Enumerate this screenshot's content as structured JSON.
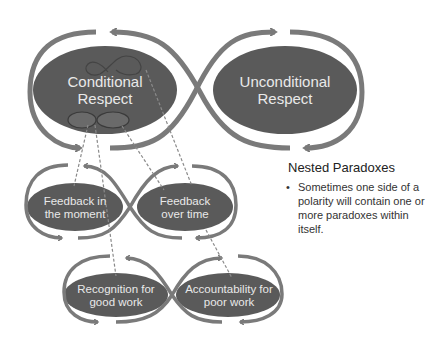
{
  "colors": {
    "ellipse_fill": "#5a5a5a",
    "loop_stroke": "#7a7a7a",
    "label_text": "#e9e9e9",
    "dashed_line": "#8a8a8a",
    "body_text": "#333333"
  },
  "top_polarity": {
    "left": "Conditional Respect",
    "left_lines": [
      "Conditional",
      "Respect"
    ],
    "right": "Unconditional Respect",
    "right_lines": [
      "Unconditional",
      "Respect"
    ]
  },
  "middle_polarity": {
    "left_lines": [
      "Feedback in",
      "the moment"
    ],
    "right_lines": [
      "Feedback",
      "over time"
    ]
  },
  "bottom_polarity": {
    "left_lines": [
      "Recognition for",
      "good work"
    ],
    "right_lines": [
      "Accountability for",
      "poor work"
    ]
  },
  "side_panel": {
    "title": "Nested Paradoxes",
    "bullets": [
      "Sometimes one side of a polarity will contain one or more paradoxes within itself."
    ]
  },
  "icons": {
    "arrow": "arrowhead",
    "bullet": "bullet-dot"
  }
}
